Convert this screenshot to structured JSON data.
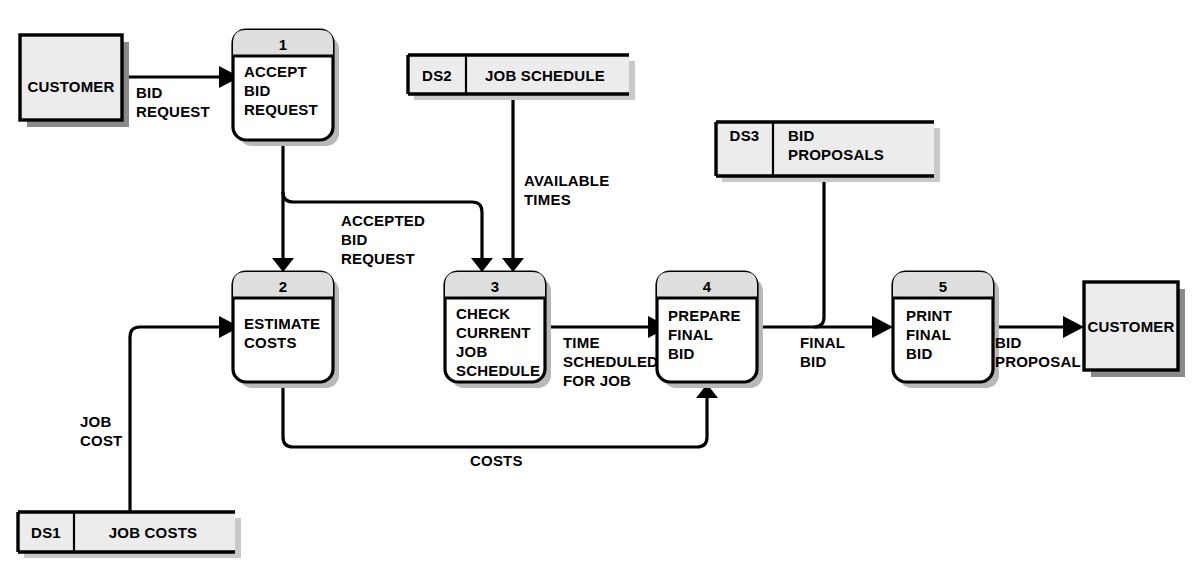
{
  "diagram": {
    "type": "data-flow-diagram"
  },
  "entities": [
    {
      "id": "customer-left",
      "label": "CUSTOMER"
    },
    {
      "id": "customer-right",
      "label": "CUSTOMER"
    }
  ],
  "data_stores": [
    {
      "id": "ds1",
      "code": "DS1",
      "name": "JOB COSTS"
    },
    {
      "id": "ds2",
      "code": "DS2",
      "name": "JOB SCHEDULE"
    },
    {
      "id": "ds3",
      "code": "DS3",
      "name_line1": "BID",
      "name_line2": "PROPOSALS"
    }
  ],
  "processes": [
    {
      "id": "p1",
      "number": "1",
      "line1": "ACCEPT",
      "line2": "BID",
      "line3": "REQUEST",
      "line4": ""
    },
    {
      "id": "p2",
      "number": "2",
      "line1": "ESTIMATE",
      "line2": "COSTS",
      "line3": "",
      "line4": ""
    },
    {
      "id": "p3",
      "number": "3",
      "line1": "CHECK",
      "line2": "CURRENT",
      "line3": "JOB",
      "line4": "SCHEDULE"
    },
    {
      "id": "p4",
      "number": "4",
      "line1": "PREPARE",
      "line2": "FINAL",
      "line3": "BID",
      "line4": ""
    },
    {
      "id": "p5",
      "number": "5",
      "line1": "PRINT",
      "line2": "FINAL",
      "line3": "BID",
      "line4": ""
    }
  ],
  "flows": [
    {
      "id": "f1",
      "line1": "BID",
      "line2": "REQUEST",
      "line3": ""
    },
    {
      "id": "f2",
      "line1": "ACCEPTED",
      "line2": "BID",
      "line3": "REQUEST"
    },
    {
      "id": "f3",
      "line1": "AVAILABLE",
      "line2": "TIMES",
      "line3": ""
    },
    {
      "id": "f4",
      "line1": "TIME",
      "line2": "SCHEDULED",
      "line3": "FOR JOB"
    },
    {
      "id": "f5",
      "line1": "FINAL",
      "line2": "BID",
      "line3": ""
    },
    {
      "id": "f6",
      "line1": "BID",
      "line2": "PROPOSAL",
      "line3": ""
    },
    {
      "id": "f7",
      "line1": "JOB",
      "line2": "COST",
      "line3": ""
    },
    {
      "id": "f8",
      "line1": "COSTS",
      "line2": "",
      "line3": ""
    }
  ],
  "colors": {
    "line": "#000000",
    "entity_fill": "#ececec",
    "store_fill": "#ececec",
    "process_header_fill": "#dedede",
    "process_body_fill": "#ffffff",
    "shadow": "#8a8a8a",
    "background": "#ffffff"
  }
}
